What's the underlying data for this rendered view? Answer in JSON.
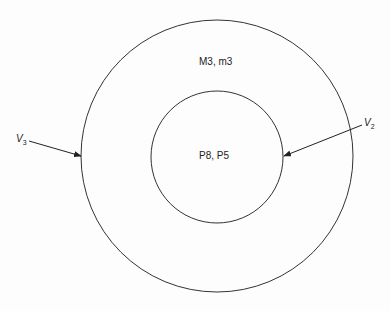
{
  "diagram": {
    "outer_circle": {
      "label": "M3, m3",
      "cx": 217,
      "cy": 156,
      "r": 136
    },
    "inner_circle": {
      "label": "P8, P5",
      "cx": 217,
      "cy": 157,
      "r": 66
    },
    "arrows": [
      {
        "name": "V",
        "subscript": "3",
        "from": [
          29,
          141
        ],
        "to": [
          82,
          156
        ],
        "target": "outer_circle"
      },
      {
        "name": "V",
        "subscript": "2",
        "from": [
          362,
          125
        ],
        "to": [
          283,
          156
        ],
        "target": "inner_circle"
      }
    ],
    "stroke_color": "#333333",
    "background_color": "#fdfdfd"
  }
}
